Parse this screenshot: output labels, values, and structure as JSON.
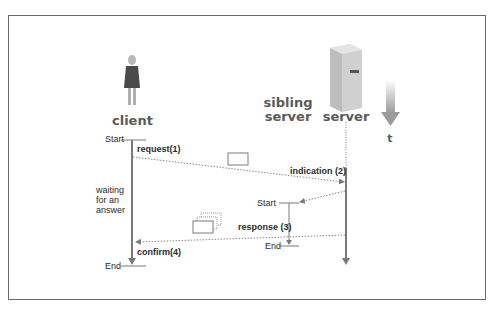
{
  "actors": {
    "client": "client",
    "sibling_server_line1": "sibling",
    "sibling_server_line2": "server",
    "server": "server",
    "time": "t"
  },
  "client_timeline": {
    "start": "Start",
    "end": "End",
    "waiting_line1": "waiting",
    "waiting_line2": "for an",
    "waiting_line3": "answer"
  },
  "sibling_timeline": {
    "start": "Start",
    "end": "End"
  },
  "messages": {
    "request": "request(1)",
    "indication": "indication (2)",
    "response": "response (3)",
    "confirm": "confirm(4)"
  },
  "colors": {
    "line": "#7a7a7a",
    "text": "#2b2b2b",
    "actor_text": "#5a5a5a",
    "frame": "#6a6a6a"
  }
}
